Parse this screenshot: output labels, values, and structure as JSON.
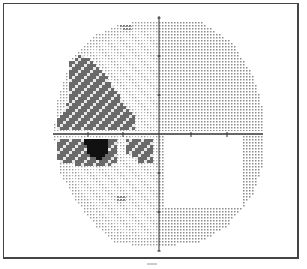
{
  "figure": {
    "type": "visual-field-greyscale-map"
  },
  "axes": {
    "center": [
      158,
      133
    ],
    "x_range": [
      52,
      262
    ],
    "y_range": [
      15,
      250
    ],
    "x_ticks": [
      87,
      122,
      190,
      226
    ],
    "y_ticks": [
      17,
      55,
      94,
      172,
      211,
      250
    ],
    "color": "#333333"
  },
  "field": {
    "outline": [
      [
        120,
        22
      ],
      [
        158,
        18
      ],
      [
        200,
        20
      ],
      [
        230,
        40
      ],
      [
        252,
        75
      ],
      [
        262,
        110
      ],
      [
        262,
        160
      ],
      [
        250,
        195
      ],
      [
        225,
        225
      ],
      [
        200,
        240
      ],
      [
        158,
        245
      ],
      [
        115,
        242
      ],
      [
        95,
        225
      ],
      [
        75,
        200
      ],
      [
        58,
        170
      ],
      [
        52,
        133
      ],
      [
        55,
        100
      ],
      [
        68,
        60
      ],
      [
        90,
        35
      ]
    ],
    "grid_step": 3
  },
  "tones": {
    "light": "#9a9a9a",
    "medium": "#8c8c8c",
    "hatched": "#7a7a7a",
    "dark": "#6a6a6a",
    "black": "#111111"
  },
  "regions": [
    {
      "name": "upper-left-wedge",
      "tone": "dark",
      "poly": [
        [
          66,
          60
        ],
        [
          80,
          52
        ],
        [
          100,
          68
        ],
        [
          115,
          90
        ],
        [
          120,
          100
        ],
        [
          132,
          112
        ],
        [
          132,
          128
        ],
        [
          55,
          128
        ],
        [
          55,
          118
        ],
        [
          66,
          100
        ]
      ]
    },
    {
      "name": "lower-left-band",
      "tone": "dark",
      "poly": [
        [
          55,
          138
        ],
        [
          115,
          138
        ],
        [
          115,
          160
        ],
        [
          100,
          165
        ],
        [
          55,
          160
        ]
      ]
    },
    {
      "name": "lower-mid-block",
      "tone": "dark",
      "poly": [
        [
          125,
          138
        ],
        [
          152,
          138
        ],
        [
          152,
          160
        ],
        [
          140,
          162
        ],
        [
          125,
          150
        ]
      ]
    },
    {
      "name": "dense-scotoma",
      "tone": "black",
      "poly": [
        [
          82,
          138
        ],
        [
          105,
          138
        ],
        [
          106,
          150
        ],
        [
          98,
          158
        ],
        [
          85,
          152
        ]
      ]
    },
    {
      "name": "top-spot",
      "tone": "hatched",
      "poly": [
        [
          118,
          23
        ],
        [
          131,
          21
        ],
        [
          130,
          27
        ],
        [
          120,
          28
        ]
      ]
    },
    {
      "name": "lower-spot",
      "tone": "hatched",
      "poly": [
        [
          116,
          193
        ],
        [
          123,
          192
        ],
        [
          122,
          199
        ],
        [
          116,
          200
        ]
      ]
    }
  ]
}
